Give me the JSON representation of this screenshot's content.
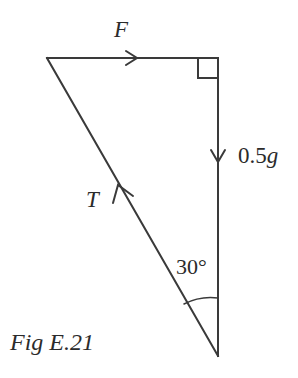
{
  "figure": {
    "caption": "Fig E.21",
    "background_color": "#ffffff",
    "stroke_color": "#3a3a3a",
    "text_color": "#2b2b2b",
    "labels": {
      "force_F": "F",
      "tension_T": "T",
      "weight_value": "0.5",
      "weight_unit": "g",
      "angle": "30°"
    },
    "geometry": {
      "top_left_vertex": [
        47,
        58
      ],
      "top_right_vertex": [
        218,
        58
      ],
      "bottom_vertex": [
        218,
        356
      ],
      "right_angle_marker_size": 20,
      "angle_arc_radius": 58
    },
    "icons": {
      "force_arrow": "arrow-right-icon",
      "weight_arrow": "arrow-down-icon",
      "tension_arrow": "arrow-up-left-icon",
      "right_angle": "right-angle-marker-icon",
      "angle_arc": "angle-arc-icon"
    }
  }
}
